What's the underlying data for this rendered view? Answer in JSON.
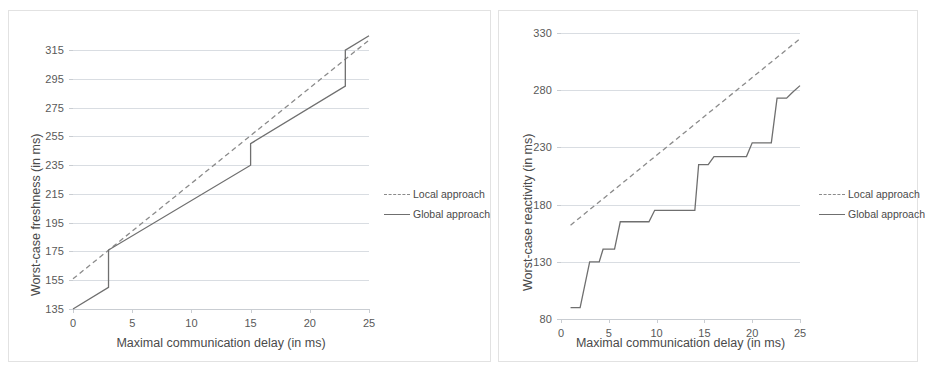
{
  "figure": {
    "panels": [
      "left",
      "right"
    ],
    "legend_entries": [
      "Local approach",
      "Global approach"
    ],
    "colors": {
      "local": "#8b8b8b",
      "global": "#6f6f6f",
      "grid": "#d9dde2",
      "text": "#595959",
      "border": "#e2e2e2"
    }
  },
  "chart_data": [
    {
      "id": "freshness",
      "type": "line",
      "title": "",
      "xlabel": "Maximal communication delay (in ms)",
      "ylabel": "Worst-case freshness (in ms)",
      "xlim": [
        0,
        25
      ],
      "ylim": [
        135,
        320
      ],
      "xticks": [
        0,
        5,
        10,
        15,
        20,
        25
      ],
      "yticks": [
        135,
        155,
        175,
        195,
        215,
        235,
        255,
        275,
        295,
        315
      ],
      "grid": true,
      "legend_position": "right",
      "series": [
        {
          "name": "Local approach",
          "style": "dashed",
          "color": "#8b8b8b",
          "points": [
            [
              0,
              156
            ],
            [
              25,
              322
            ]
          ]
        },
        {
          "name": "Global approach",
          "style": "solid",
          "color": "#6f6f6f",
          "points": [
            [
              0,
              135
            ],
            [
              3,
              150
            ],
            [
              3,
              176
            ],
            [
              15,
              235
            ],
            [
              15,
              250
            ],
            [
              23,
              290
            ],
            [
              23,
              315
            ],
            [
              25,
              325
            ]
          ]
        }
      ]
    },
    {
      "id": "reactivity",
      "type": "line",
      "title": "",
      "xlabel": "Maximal communication delay (in ms)",
      "ylabel": "Worst-case reactivity (in ms)",
      "xlim": [
        0,
        25
      ],
      "ylim": [
        80,
        330
      ],
      "xticks": [
        0,
        5,
        10,
        15,
        20,
        25
      ],
      "yticks": [
        80,
        130,
        180,
        230,
        280,
        330
      ],
      "grid": true,
      "legend_position": "right",
      "series": [
        {
          "name": "Local approach",
          "style": "dashed",
          "color": "#8b8b8b",
          "points": [
            [
              1,
              162
            ],
            [
              25,
              325
            ]
          ]
        },
        {
          "name": "Global approach",
          "style": "solid",
          "color": "#6f6f6f",
          "points": [
            [
              1,
              90
            ],
            [
              2,
              90
            ],
            [
              3,
              130
            ],
            [
              4,
              130
            ],
            [
              4.4,
              141
            ],
            [
              5.6,
              141
            ],
            [
              6.2,
              165
            ],
            [
              7.2,
              165
            ],
            [
              9.2,
              165
            ],
            [
              9.8,
              175
            ],
            [
              14,
              175
            ],
            [
              14.4,
              215
            ],
            [
              15.4,
              215
            ],
            [
              16,
              222
            ],
            [
              19.4,
              222
            ],
            [
              20,
              234
            ],
            [
              22,
              234
            ],
            [
              22.6,
              273
            ],
            [
              23.6,
              273
            ],
            [
              24.2,
              278
            ],
            [
              25,
              284
            ]
          ]
        }
      ]
    }
  ]
}
